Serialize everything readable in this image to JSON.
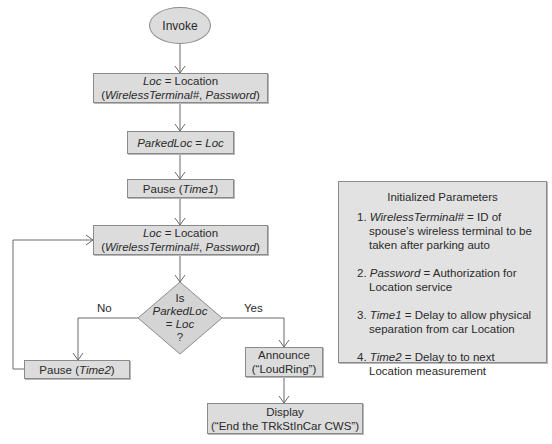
{
  "flowchart": {
    "start": {
      "label": "Invoke"
    },
    "step1": {
      "line1_var": "Loc",
      "line1_rest": " = Location",
      "line2_open": "(",
      "line2_arg1": "WirelessTerminal#",
      "line2_sep": ", ",
      "line2_arg2": "Password",
      "line2_close": ")"
    },
    "step2": {
      "var": "ParkedLoc",
      "rest": " = ",
      "var2": "Loc"
    },
    "step3": {
      "prefix": "Pause (",
      "var": "Time1",
      "suffix": ")"
    },
    "step4": {
      "line1_var": "Loc",
      "line1_rest": " = Location",
      "line2_open": "(",
      "line2_arg1": "WirelessTerminal#",
      "line2_sep": ", ",
      "line2_arg2": "Password",
      "line2_close": ")"
    },
    "decision": {
      "line1": "Is",
      "line2": "ParkedLoc",
      "line3_prefix": "= ",
      "line3_var": "Loc",
      "line4": "?"
    },
    "no_label": "No",
    "yes_label": "Yes",
    "pause2": {
      "prefix": "Pause (",
      "var": "Time2",
      "suffix": ")"
    },
    "announce": {
      "line1": "Announce",
      "line2": "(“LoudRing”)"
    },
    "display": {
      "line1": "Display",
      "line2": "(“End the TRkStInCar CWS”)"
    }
  },
  "params": {
    "title": "Initialized Parameters",
    "items": [
      {
        "num": "1. ",
        "var": "WirelessTerminal#",
        "text": " = ID of spouse’s wireless terminal to be taken after parking auto"
      },
      {
        "num": "2. ",
        "var": "Password",
        "text": " = Authorization for Location service"
      },
      {
        "num": "3. ",
        "var": "Time1",
        "text": " = Delay to allow physical separation from car Location"
      },
      {
        "num": "4. ",
        "var": "Time2",
        "text": " = Delay to to next Location measurement"
      }
    ]
  }
}
